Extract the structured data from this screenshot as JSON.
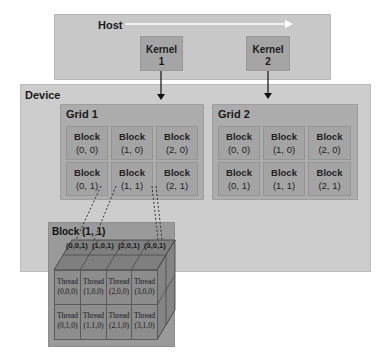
{
  "host": {
    "label": "Host"
  },
  "kernels": [
    {
      "label_line1": "Kernel",
      "label_line2": "1"
    },
    {
      "label_line1": "Kernel",
      "label_line2": "2"
    }
  ],
  "device": {
    "label": "Device"
  },
  "grids": [
    {
      "label": "Grid 1",
      "blocks": [
        {
          "name": "Block",
          "coord": "(0, 0)"
        },
        {
          "name": "Block",
          "coord": "(1, 0)"
        },
        {
          "name": "Block",
          "coord": "(2, 0)"
        },
        {
          "name": "Block",
          "coord": "(0, 1)"
        },
        {
          "name": "Block",
          "coord": "(1, 1)"
        },
        {
          "name": "Block",
          "coord": "(2, 1)"
        }
      ]
    },
    {
      "label": "Grid  2",
      "blocks": [
        {
          "name": "Block",
          "coord": "(0, 0)"
        },
        {
          "name": "Block",
          "coord": "(1, 0)"
        },
        {
          "name": "Block",
          "coord": "(2, 0)"
        },
        {
          "name": "Block",
          "coord": "(0, 1)"
        },
        {
          "name": "Block",
          "coord": "(1, 1)"
        },
        {
          "name": "Block",
          "coord": "(2, 1)"
        }
      ]
    }
  ],
  "block_detail": {
    "label": "Block (1, 1)",
    "top_labels": [
      "(0,0,1)",
      "(1,0,1)",
      "(2,0,1)",
      "(3,0,1)"
    ],
    "threads": [
      {
        "name": "Thread",
        "coord": "(0,0,0)"
      },
      {
        "name": "Thread",
        "coord": "(1,0,0)"
      },
      {
        "name": "Thread",
        "coord": "(2,0,0)"
      },
      {
        "name": "Thread",
        "coord": "(3,0,0)"
      },
      {
        "name": "Thread",
        "coord": "(0,1,0)"
      },
      {
        "name": "Thread",
        "coord": "(1,1,0)"
      },
      {
        "name": "Thread",
        "coord": "(2,1,0)"
      },
      {
        "name": "Thread",
        "coord": "(3,1,0)"
      }
    ]
  }
}
